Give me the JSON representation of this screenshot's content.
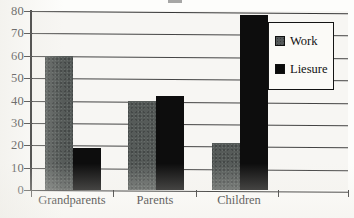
{
  "chart_data": {
    "type": "bar",
    "title": "",
    "xlabel": "",
    "ylabel": "",
    "categories": [
      "Grandparents",
      "Parents",
      "Children"
    ],
    "series": [
      {
        "name": "Work",
        "values": [
          60,
          40,
          21
        ],
        "color": "#565b59"
      },
      {
        "name": "Liesure",
        "values": [
          19,
          42,
          78
        ],
        "color": "#0d0d0d"
      }
    ],
    "ylim": [
      0,
      80
    ],
    "yticks": [
      0,
      10,
      20,
      30,
      40,
      50,
      60,
      70,
      80
    ],
    "ytick_labels": [
      "0",
      "10",
      "20",
      "30",
      "40",
      "50",
      "60",
      "70",
      "80"
    ],
    "grid": true,
    "legend_position": "top-right"
  },
  "legend": {
    "items": [
      {
        "label": "Work",
        "swatch": "work-swatch"
      },
      {
        "label": "Liesure",
        "swatch": "leisure-swatch"
      }
    ]
  }
}
